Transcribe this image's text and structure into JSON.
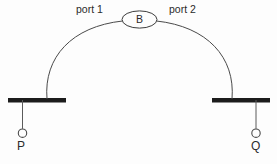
{
  "diagram": {
    "title": "",
    "colors": {
      "bar": "#1c1c1c",
      "line": "#4a4a4a",
      "text": "#2b2b2b",
      "background": "#fdfdfd"
    },
    "nodes": [
      {
        "id": "bridge",
        "label": "B",
        "shape": "ellipse",
        "cx": 139,
        "cy": 19.5,
        "rx": 17,
        "ry": 8.5
      }
    ],
    "segments": [
      {
        "id": "left-segment",
        "label": "",
        "bar": {
          "x1": 8,
          "x2": 66,
          "y": 100,
          "thickness": 4.5
        },
        "drop": {
          "x": 22,
          "y1": 100,
          "y2": 129
        },
        "terminal": {
          "id": "p-terminal",
          "label": "P",
          "cx": 22,
          "cy": 133,
          "r": 4.2
        },
        "arc_anchor": {
          "x": 47,
          "y": 99
        }
      },
      {
        "id": "right-segment",
        "label": "",
        "bar": {
          "x1": 212,
          "x2": 270,
          "y": 100,
          "thickness": 4.5
        },
        "drop": {
          "x": 256,
          "y1": 100,
          "y2": 129
        },
        "terminal": {
          "id": "q-terminal",
          "label": "Q",
          "cx": 256,
          "cy": 133,
          "r": 4.2
        },
        "arc_anchor": {
          "x": 232,
          "y": 99
        }
      }
    ],
    "links": [
      {
        "id": "port1-link",
        "label": "port 1",
        "from": "left-segment",
        "to": "bridge",
        "path": "M 47 99 C 44 58, 72 26, 122 21"
      },
      {
        "id": "port2-link",
        "label": "port 2",
        "from": "bridge",
        "to": "right-segment",
        "path": "M 157 21 C 207 26, 235 58, 232 99"
      }
    ],
    "labels": {
      "port1": "port 1",
      "port2": "port 2",
      "bridge": "B",
      "p": "P",
      "q": "Q"
    }
  }
}
